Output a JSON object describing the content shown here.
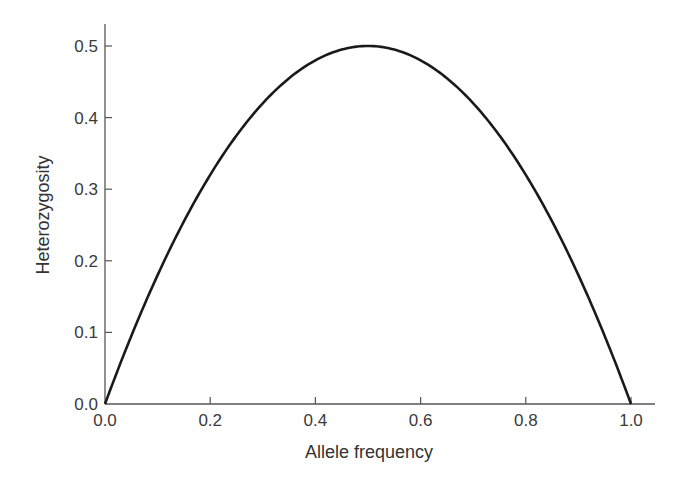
{
  "chart_data": {
    "type": "line",
    "title": "",
    "xlabel": "Allele frequency",
    "ylabel": "Heterozygosity",
    "xlim": [
      0.0,
      1.0
    ],
    "ylim": [
      0.0,
      0.5
    ],
    "grid": false,
    "legend": null,
    "x_ticks": [
      "0.0",
      "0.2",
      "0.4",
      "0.6",
      "0.8",
      "1.0"
    ],
    "y_ticks": [
      "0.0",
      "0.1",
      "0.2",
      "0.3",
      "0.4",
      "0.5"
    ],
    "series": [
      {
        "name": "Heterozygosity = 2p(1-p)",
        "x": [
          0.0,
          0.1,
          0.2,
          0.3,
          0.4,
          0.5,
          0.6,
          0.7,
          0.8,
          0.9,
          1.0
        ],
        "y": [
          0.0,
          0.18,
          0.32,
          0.42,
          0.48,
          0.5,
          0.48,
          0.42,
          0.32,
          0.18,
          0.0
        ]
      }
    ],
    "colors": {
      "line": "#1a1a1a",
      "axis": "#555555"
    }
  }
}
